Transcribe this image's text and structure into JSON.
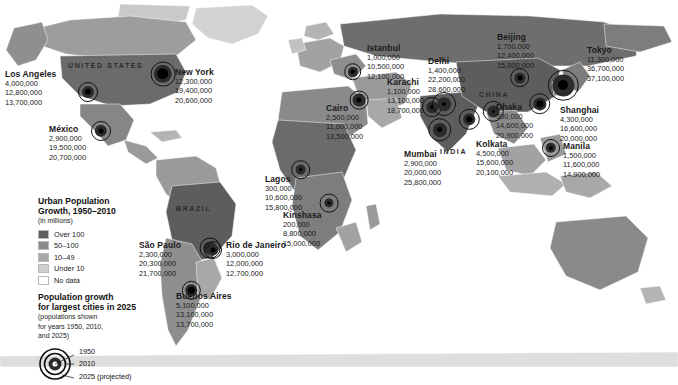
{
  "legend": {
    "title": "Urban Population\nGrowth, 1950–2010",
    "title_line1": "Urban Population",
    "title_line2": "Growth, 1950–2010",
    "subtitle": "(in millions)",
    "classes": [
      {
        "label": "Over 100",
        "color": "#5d5d5d"
      },
      {
        "label": "50–100",
        "color": "#8a8a8a"
      },
      {
        "label": "10–49",
        "color": "#a8a8a8"
      },
      {
        "label": "Under 10",
        "color": "#cfcfcf"
      },
      {
        "label": "No data",
        "color": "#ffffff"
      }
    ],
    "symbol_title_line1": "Population growth",
    "symbol_title_line2": "for largest cities in 2025",
    "symbol_note_line1": "(populations shown",
    "symbol_note_line2": "for years 1950, 2010,",
    "symbol_note_line3": "and 2025)",
    "symbol_years": [
      "1950",
      "2010",
      "2025 (projected)"
    ]
  },
  "country_labels": [
    {
      "name": "UNITED STATES",
      "x": 68,
      "y": 62
    },
    {
      "name": "BRAZIL",
      "x": 176,
      "y": 205
    },
    {
      "name": "CHINA",
      "x": 479,
      "y": 91
    },
    {
      "name": "INDIA",
      "x": 440,
      "y": 148
    }
  ],
  "chart_data": {
    "type": "map",
    "title": "Urban Population Growth, 1950–2010",
    "units": "people",
    "years": [
      1950,
      2010,
      2025
    ],
    "cities": [
      {
        "name": "Los Angeles",
        "values": [
          "4,000,000",
          "12,800,000",
          "13,700,000"
        ],
        "mx": 88,
        "my": 92,
        "r1950": 3.2,
        "r2010": 6.0,
        "r2025": 10.0,
        "lx": 5,
        "ly": 70,
        "nx": 5,
        "ny": 79,
        "align": "left"
      },
      {
        "name": "New York",
        "values": [
          "12,300,000",
          "19,400,000",
          "20,600,000"
        ],
        "mx": 163,
        "my": 74,
        "r1950": 5.6,
        "r2010": 9.0,
        "r2025": 12.2,
        "lx": 175,
        "ly": 68,
        "nx": 175,
        "ny": 77,
        "align": "left"
      },
      {
        "name": "México",
        "values": [
          "2,900,000",
          "19,500,000",
          "20,700,000"
        ],
        "mx": 101,
        "my": 131,
        "r1950": 2.4,
        "r2010": 6.2,
        "r2025": 10.0,
        "lx": 49,
        "ly": 125,
        "nx": 49,
        "ny": 134,
        "align": "left"
      },
      {
        "name": "São Paulo",
        "values": [
          "2,300,000",
          "20,300,000",
          "21,700,000"
        ],
        "mx": 210,
        "my": 248,
        "r1950": 2.3,
        "r2010": 6.4,
        "r2025": 10.2,
        "lx": 139,
        "ly": 241,
        "nx": 139,
        "ny": 250,
        "align": "left"
      },
      {
        "name": "Rio de Janeiro",
        "values": [
          "3,000,000",
          "12,000,000",
          "12,700,000"
        ],
        "mx": 213,
        "my": 250,
        "r1950": 2.5,
        "r2010": 5.6,
        "r2025": 9.0,
        "lx": 226,
        "ly": 241,
        "nx": 226,
        "ny": 250,
        "align": "left"
      },
      {
        "name": "Buenos Aires",
        "values": [
          "5,100,000",
          "13,100,000",
          "13,700,000"
        ],
        "mx": 191,
        "my": 290,
        "r1950": 3.6,
        "r2010": 6.2,
        "r2025": 9.6,
        "lx": 176,
        "ly": 292,
        "nx": 176,
        "ny": 301,
        "align": "left"
      },
      {
        "name": "Lagos",
        "values": [
          "300,000",
          "10,600,000",
          "15,800,000"
        ],
        "mx": 301,
        "my": 170,
        "r1950": 1.5,
        "r2010": 5.0,
        "r2025": 9.4,
        "lx": 265,
        "ly": 175,
        "nx": 265,
        "ny": 184,
        "align": "left"
      },
      {
        "name": "Kinshasa",
        "values": [
          "200,000",
          "8,800,000",
          "15,000,000"
        ],
        "mx": 329,
        "my": 203,
        "r1950": 1.3,
        "r2010": 4.4,
        "r2025": 9.2,
        "lx": 283,
        "ly": 211,
        "nx": 283,
        "ny": 220,
        "align": "left"
      },
      {
        "name": "Cairo",
        "values": [
          "2,500,000",
          "11,000,000",
          "13,500,000"
        ],
        "mx": 359,
        "my": 100,
        "r1950": 2.4,
        "r2010": 6.2,
        "r2025": 9.2,
        "lx": 326,
        "ly": 104,
        "nx": 326,
        "ny": 113,
        "align": "left"
      },
      {
        "name": "Istanbul",
        "values": [
          "1,000,000",
          "10,500,000",
          "12,100,000"
        ],
        "mx": 353,
        "my": 72,
        "r1950": 1.9,
        "r2010": 4.6,
        "r2025": 8.4,
        "lx": 367,
        "ly": 44,
        "nx": 367,
        "ny": 53,
        "align": "left"
      },
      {
        "name": "Karachi",
        "values": [
          "1,100,000",
          "13,100,000",
          "18,700,000"
        ],
        "mx": 432,
        "my": 107,
        "r1950": 2.0,
        "r2010": 5.8,
        "r2025": 10.0,
        "lx": 387,
        "ly": 78,
        "nx": 387,
        "ny": 87,
        "align": "left"
      },
      {
        "name": "Delhi",
        "values": [
          "1,400,000",
          "22,200,000",
          "28,600,000"
        ],
        "mx": 444,
        "my": 104,
        "r1950": 2.1,
        "r2010": 6.8,
        "r2025": 12.0,
        "lx": 428,
        "ly": 57,
        "nx": 428,
        "ny": 66,
        "align": "left"
      },
      {
        "name": "Mumbai",
        "values": [
          "2,900,000",
          "20,000,000",
          "25,800,000"
        ],
        "mx": 440,
        "my": 130,
        "r1950": 2.5,
        "r2010": 6.6,
        "r2025": 11.4,
        "lx": 404,
        "ly": 150,
        "nx": 404,
        "ny": 159,
        "align": "left"
      },
      {
        "name": "Kolkata",
        "values": [
          "4,500,000",
          "15,600,000",
          "20,100,000"
        ],
        "mx": 469,
        "my": 119,
        "r1950": 3.2,
        "r2010": 6.2,
        "r2025": 10.6,
        "lx": 476,
        "ly": 140,
        "nx": 476,
        "ny": 149,
        "align": "left"
      },
      {
        "name": "Dhaka",
        "values": [
          "300,000",
          "14,600,000",
          "20,900,000"
        ],
        "mx": 493,
        "my": 111,
        "r1950": 1.5,
        "r2010": 6.0,
        "r2025": 10.6,
        "lx": 496,
        "ly": 103,
        "nx": 496,
        "ny": 112,
        "align": "left"
      },
      {
        "name": "Beijing",
        "values": [
          "1,700,000",
          "12,400,000",
          "15,000,000"
        ],
        "mx": 520,
        "my": 78,
        "r1950": 2.1,
        "r2010": 5.2,
        "r2025": 9.4,
        "lx": 497,
        "ly": 33,
        "nx": 497,
        "ny": 42,
        "align": "left"
      },
      {
        "name": "Shanghai",
        "values": [
          "4,300,000",
          "16,600,000",
          "20,000,000"
        ],
        "mx": 540,
        "my": 104,
        "r1950": 3.2,
        "r2010": 6.2,
        "r2025": 10.4,
        "lx": 560,
        "ly": 106,
        "nx": 560,
        "ny": 115,
        "align": "left"
      },
      {
        "name": "Tokyo",
        "values": [
          "11,300,000",
          "36,700,000",
          "37,100,000"
        ],
        "mx": 563,
        "my": 85,
        "r1950": 5.4,
        "r2010": 11.0,
        "r2025": 15.6,
        "lx": 587,
        "ly": 46,
        "nx": 587,
        "ny": 55,
        "align": "left"
      },
      {
        "name": "Manila",
        "values": [
          "1,500,000",
          "11,600,000",
          "14,900,000"
        ],
        "mx": 551,
        "my": 148,
        "r1950": 2.1,
        "r2010": 5.2,
        "r2025": 9.0,
        "lx": 563,
        "ly": 142,
        "nx": 563,
        "ny": 151,
        "align": "left"
      }
    ]
  }
}
